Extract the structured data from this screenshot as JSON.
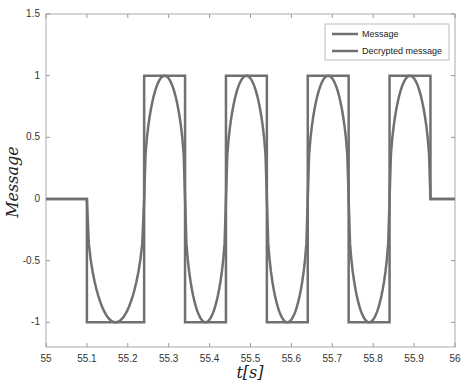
{
  "chart_data": {
    "type": "line",
    "title": "",
    "xlabel": "t[s]",
    "ylabel": "Message",
    "xlim": [
      55,
      56
    ],
    "ylim": [
      -1.2,
      1.5
    ],
    "xticks": [
      "55",
      "55.1",
      "55.2",
      "55.3",
      "55.4",
      "55.5",
      "55.6",
      "55.7",
      "55.8",
      "55.9",
      "56"
    ],
    "yticks": [
      "1.5",
      "1",
      "0.5",
      "0",
      "-0.5",
      "-1"
    ],
    "grid": false,
    "legend_position": "upper right",
    "series": [
      {
        "name": "Message",
        "style": "square wave",
        "points": [
          [
            55,
            0
          ],
          [
            55.1,
            0
          ],
          [
            55.1,
            -1
          ],
          [
            55.24,
            -1
          ],
          [
            55.24,
            1
          ],
          [
            55.34,
            1
          ],
          [
            55.34,
            -1
          ],
          [
            55.44,
            -1
          ],
          [
            55.44,
            1
          ],
          [
            55.54,
            1
          ],
          [
            55.54,
            -1
          ],
          [
            55.64,
            -1
          ],
          [
            55.64,
            1
          ],
          [
            55.74,
            1
          ],
          [
            55.74,
            -1
          ],
          [
            55.84,
            -1
          ],
          [
            55.84,
            1
          ],
          [
            55.94,
            1
          ],
          [
            55.94,
            0
          ],
          [
            56,
            0
          ]
        ]
      },
      {
        "name": "Decrypted message",
        "style": "smooth sinusoid-like following square wave",
        "points": [
          [
            55,
            0
          ],
          [
            55.1,
            0
          ],
          [
            55.17,
            -1
          ],
          [
            55.24,
            0
          ],
          [
            55.29,
            1
          ],
          [
            55.34,
            0
          ],
          [
            55.39,
            -1
          ],
          [
            55.44,
            0
          ],
          [
            55.49,
            1
          ],
          [
            55.54,
            0
          ],
          [
            55.59,
            -1
          ],
          [
            55.64,
            0
          ],
          [
            55.69,
            1
          ],
          [
            55.74,
            0
          ],
          [
            55.79,
            -1
          ],
          [
            55.84,
            0
          ],
          [
            55.89,
            1
          ],
          [
            55.94,
            0
          ],
          [
            56,
            0
          ]
        ]
      }
    ]
  },
  "legend": {
    "items": [
      "Message",
      "Decrypted message"
    ]
  },
  "colors": {
    "line": "#707070",
    "axis": "#999999"
  }
}
